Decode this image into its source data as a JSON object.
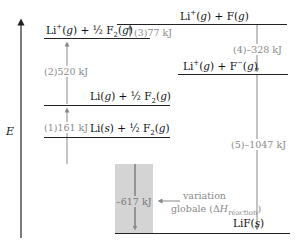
{
  "diagram": {
    "axis_label": "E",
    "levels": [
      {
        "id": "li-plus-f",
        "label_html": "Li<sup>+</sup>(<i>g</i>) + F(<i>g</i>)"
      },
      {
        "id": "li-plus-half-f2",
        "label_html": "Li<sup>+</sup>(<i>g</i>) + ½ F<sub>2</sub>(<i>g</i>)"
      },
      {
        "id": "li-plus-f-minus",
        "label_html": "Li<sup>+</sup>(<i>g</i>) + F<sup>−</sup>(<i>g</i>)"
      },
      {
        "id": "li-g-half-f2",
        "label_html": "Li(<i>g</i>) + ½ F<sub>2</sub>(<i>g</i>)"
      },
      {
        "id": "li-s-half-f2",
        "label_html": "Li(<i>s</i>) + ½ F<sub>2</sub>(<i>g</i>)"
      },
      {
        "id": "lif-s",
        "label_html": "LiF(<i>s</i>)"
      }
    ],
    "steps": [
      {
        "id": "1",
        "label": "(1)161 kJ"
      },
      {
        "id": "2",
        "label": "(2)520 kJ"
      },
      {
        "id": "3",
        "label": "(3)77 kJ"
      },
      {
        "id": "4",
        "label": "(4)–328 kJ"
      },
      {
        "id": "5",
        "label": "(5)–1047 kJ"
      }
    ],
    "overall": {
      "value": "–617 kJ",
      "annotation_line1": "variation",
      "annotation_line2_html": "globale (Δ<i>H</i><sub>réaction</sub>)"
    }
  }
}
